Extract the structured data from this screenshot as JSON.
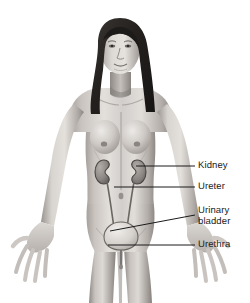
{
  "figure": {
    "background_color": "#ffffff",
    "style": "grayscale medical illustration",
    "width": 250,
    "height": 303
  },
  "labels": [
    {
      "id": "kidney",
      "text": "Kidney",
      "color": "#1b1b1b"
    },
    {
      "id": "ureter",
      "text": "Ureter",
      "color": "#1b1b1b"
    },
    {
      "id": "bladder",
      "text": "Urinary\nbladder",
      "color": "#1b1b1b"
    },
    {
      "id": "urethra",
      "text": "Urethra",
      "color": "#1b1b1b"
    }
  ],
  "leader_lines": [
    {
      "id": "kidney",
      "x1": 136,
      "y1": 166,
      "x2": 195,
      "y2": 166,
      "color": "#1b1b1b"
    },
    {
      "id": "ureter",
      "x1": 114,
      "y1": 187,
      "x2": 195,
      "y2": 187,
      "color": "#1b1b1b"
    },
    {
      "id": "bladder",
      "x1": 110,
      "y1": 231,
      "x2": 195,
      "y2": 215,
      "color": "#1b1b1b"
    },
    {
      "id": "urethra",
      "x1": 108,
      "y1": 245,
      "x2": 195,
      "y2": 245,
      "color": "#1b1b1b"
    }
  ],
  "organs": [
    {
      "id": "kidney-left",
      "name": "Kidney",
      "shape": "bean"
    },
    {
      "id": "kidney-right",
      "name": "Kidney",
      "shape": "bean"
    },
    {
      "id": "ureter-left",
      "name": "Ureter",
      "shape": "tube"
    },
    {
      "id": "ureter-right",
      "name": "Ureter",
      "shape": "tube"
    },
    {
      "id": "bladder",
      "name": "Urinary bladder",
      "shape": "oval"
    },
    {
      "id": "urethra",
      "name": "Urethra",
      "shape": "tube"
    }
  ],
  "palette": {
    "skin_light": "#e6e2de",
    "skin_mid": "#b9b4b0",
    "skin_shadow": "#8d8884",
    "skin_deep": "#6a6662",
    "hair": "#2a2726",
    "organ_outline": "#4a4644",
    "bladder_fill": "#dcd8d4",
    "line": "#1b1b1b"
  }
}
